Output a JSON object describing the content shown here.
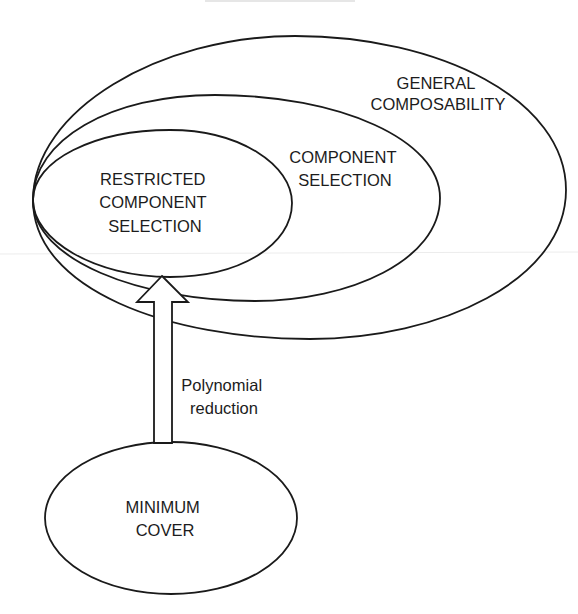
{
  "diagram": {
    "type": "nested-set-diagram",
    "sets": [
      {
        "id": "general",
        "label_lines": [
          "GENERAL",
          "COMPOSABILITY"
        ]
      },
      {
        "id": "component",
        "label_lines": [
          "COMPONENT",
          "SELECTION"
        ]
      },
      {
        "id": "restricted",
        "label_lines": [
          "RESTRICTED",
          "COMPONENT",
          "SELECTION"
        ]
      }
    ],
    "source_node": {
      "id": "minimum-cover",
      "label_lines": [
        "MINIMUM",
        "COVER"
      ]
    },
    "edge": {
      "from": "minimum-cover",
      "to": "restricted",
      "label_lines": [
        "Polynomial",
        "reduction"
      ],
      "style": "hollow-block-arrow"
    },
    "colors": {
      "stroke": "#1a1a1a",
      "text": "#1c1c1c",
      "background": "#ffffff"
    }
  }
}
